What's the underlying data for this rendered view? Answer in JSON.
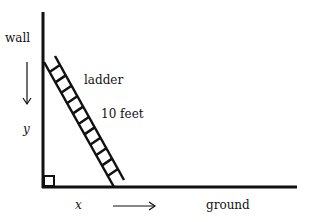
{
  "diagram": {
    "labels": {
      "wall": "wall",
      "ladder": "ladder",
      "length": "10 feet",
      "y": "y",
      "x": "x",
      "ground": "ground"
    },
    "elements": {
      "wall": "vertical line",
      "ground": "horizontal line",
      "ladder": "ladder leaning against wall",
      "right_angle_marker": "square at corner",
      "down_arrow": "arrow pointing down beside wall",
      "right_arrow": "arrow pointing right along ground"
    },
    "colors": {
      "stroke": "#111111",
      "background": "#ffffff"
    }
  }
}
